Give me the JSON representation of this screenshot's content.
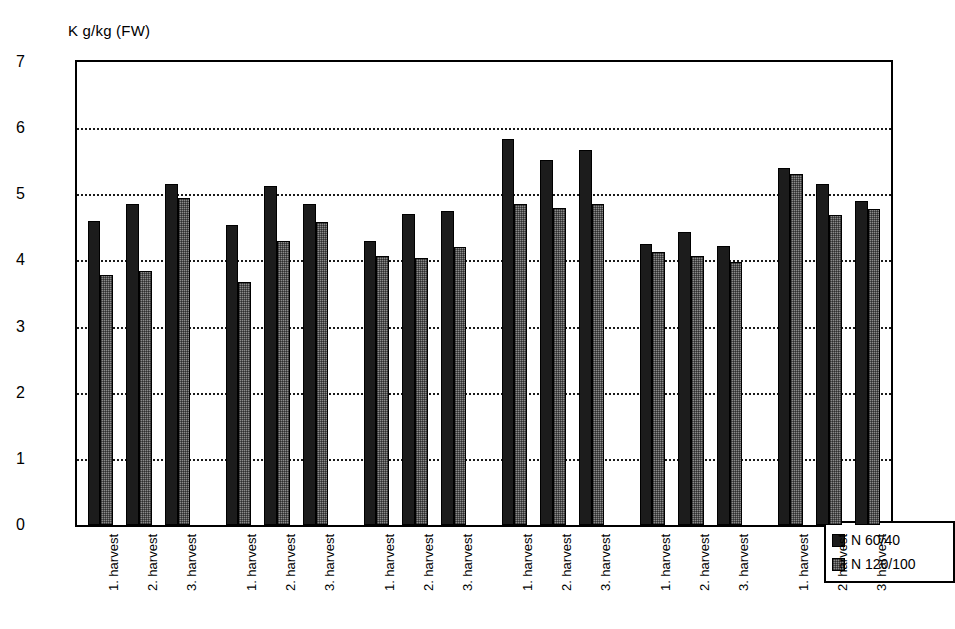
{
  "chart_data": {
    "type": "bar",
    "title": "",
    "subtitle": "",
    "xlabel": "",
    "ylabel": "K g/kg (FW)",
    "ylim": [
      0,
      7
    ],
    "yticks": [
      0,
      1,
      2,
      3,
      4,
      5,
      6,
      7
    ],
    "ytick_labels": [
      "0",
      "1",
      "2",
      "3",
      "4",
      "5",
      "6",
      "7"
    ],
    "grid": "horizontal-dotted",
    "legend_position": "inside-bottom-right",
    "group_labels": [
      "Fambo",
      "Timate",
      "Asterix",
      "Lady Rosetta",
      "Nicola",
      "Vento"
    ],
    "categories": [
      "1. harvest",
      "2. harvest",
      "3. harvest",
      "1. harvest",
      "2. harvest",
      "3. harvest",
      "1. harvest",
      "2. harvest",
      "3. harvest",
      "1. harvest",
      "2. harvest",
      "3. harvest",
      "1. harvest",
      "2. harvest",
      "3. harvest",
      "1. harvest",
      "2. harvest",
      "3. harvest"
    ],
    "series": [
      {
        "name": "N 60/40",
        "color": "#1c1c1c",
        "values": [
          4.6,
          4.85,
          5.15,
          4.53,
          5.12,
          4.85,
          4.3,
          4.7,
          4.75,
          5.83,
          5.52,
          5.67,
          4.25,
          4.43,
          4.22,
          5.4,
          5.15,
          4.9
        ]
      },
      {
        "name": "N 120/100",
        "color": "#8a8a8a",
        "values": [
          3.78,
          3.84,
          4.95,
          3.68,
          4.3,
          4.58,
          4.07,
          4.03,
          4.2,
          4.85,
          4.8,
          4.85,
          4.13,
          4.07,
          3.98,
          5.3,
          4.68,
          4.78
        ]
      }
    ]
  },
  "legend": {
    "items": [
      {
        "label": "N 60/40",
        "swatch": "dark-swatch"
      },
      {
        "label": "N 120/100",
        "swatch": "gray-swatch"
      }
    ]
  }
}
